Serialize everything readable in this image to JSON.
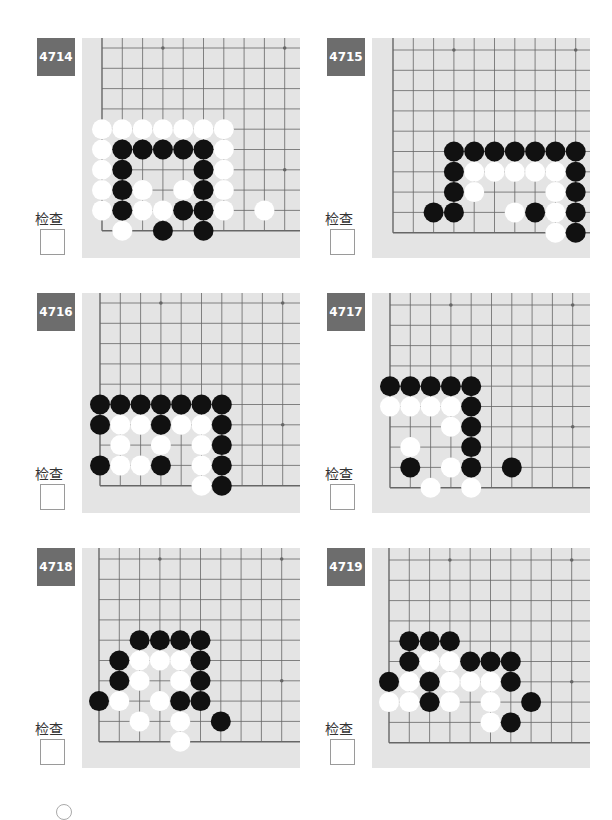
{
  "check_label": "检查",
  "colors": {
    "label_bg": "#6d6d6d",
    "board_bg": "#e4e4e4",
    "grid_line": "#666666",
    "black_stone": "#111111",
    "white_stone": "#ffffff"
  },
  "problems": [
    {
      "id": "4714",
      "pos": [
        30,
        30
      ],
      "grid_origin": [
        20,
        10
      ],
      "stones": {
        "white": [
          [
            0,
            4
          ],
          [
            1,
            4
          ],
          [
            2,
            4
          ],
          [
            3,
            4
          ],
          [
            4,
            4
          ],
          [
            5,
            4
          ],
          [
            6,
            4
          ],
          [
            0,
            5
          ],
          [
            6,
            5
          ],
          [
            0,
            6
          ],
          [
            6,
            6
          ],
          [
            0,
            7
          ],
          [
            2,
            7
          ],
          [
            4,
            7
          ],
          [
            6,
            7
          ],
          [
            0,
            8
          ],
          [
            2,
            8
          ],
          [
            3,
            8
          ],
          [
            6,
            8
          ],
          [
            8,
            8
          ],
          [
            1,
            9
          ]
        ],
        "black": [
          [
            1,
            5
          ],
          [
            2,
            5
          ],
          [
            3,
            5
          ],
          [
            4,
            5
          ],
          [
            5,
            5
          ],
          [
            1,
            6
          ],
          [
            5,
            6
          ],
          [
            1,
            7
          ],
          [
            5,
            7
          ],
          [
            1,
            8
          ],
          [
            4,
            8
          ],
          [
            5,
            8
          ],
          [
            3,
            9
          ],
          [
            5,
            9
          ]
        ]
      }
    },
    {
      "id": "4715",
      "pos": [
        320,
        30
      ],
      "grid_origin": [
        21,
        12
      ],
      "stones": {
        "white": [
          [
            4,
            6
          ],
          [
            5,
            6
          ],
          [
            6,
            6
          ],
          [
            7,
            6
          ],
          [
            8,
            6
          ],
          [
            4,
            7
          ],
          [
            8,
            7
          ],
          [
            6,
            8
          ],
          [
            8,
            8
          ],
          [
            8,
            9
          ]
        ],
        "black": [
          [
            3,
            5
          ],
          [
            4,
            5
          ],
          [
            5,
            5
          ],
          [
            6,
            5
          ],
          [
            7,
            5
          ],
          [
            8,
            5
          ],
          [
            9,
            5
          ],
          [
            3,
            6
          ],
          [
            9,
            6
          ],
          [
            3,
            7
          ],
          [
            9,
            7
          ],
          [
            2,
            8
          ],
          [
            3,
            8
          ],
          [
            7,
            8
          ],
          [
            9,
            8
          ],
          [
            9,
            9
          ]
        ]
      }
    },
    {
      "id": "4716",
      "pos": [
        30,
        285
      ],
      "grid_origin": [
        18,
        10
      ],
      "stones": {
        "white": [
          [
            1,
            6
          ],
          [
            2,
            6
          ],
          [
            4,
            6
          ],
          [
            5,
            6
          ],
          [
            1,
            7
          ],
          [
            3,
            7
          ],
          [
            5,
            7
          ],
          [
            1,
            8
          ],
          [
            2,
            8
          ],
          [
            5,
            8
          ],
          [
            5,
            9
          ]
        ],
        "black": [
          [
            0,
            5
          ],
          [
            1,
            5
          ],
          [
            2,
            5
          ],
          [
            3,
            5
          ],
          [
            4,
            5
          ],
          [
            5,
            5
          ],
          [
            6,
            5
          ],
          [
            0,
            6
          ],
          [
            3,
            6
          ],
          [
            6,
            6
          ],
          [
            6,
            7
          ],
          [
            0,
            8
          ],
          [
            3,
            8
          ],
          [
            6,
            8
          ],
          [
            6,
            9
          ]
        ]
      }
    },
    {
      "id": "4717",
      "pos": [
        320,
        285
      ],
      "grid_origin": [
        18,
        12
      ],
      "stones": {
        "white": [
          [
            0,
            5
          ],
          [
            1,
            5
          ],
          [
            2,
            5
          ],
          [
            3,
            5
          ],
          [
            3,
            6
          ],
          [
            1,
            7
          ],
          [
            3,
            8
          ],
          [
            2,
            9
          ],
          [
            4,
            9
          ]
        ],
        "black": [
          [
            0,
            4
          ],
          [
            1,
            4
          ],
          [
            2,
            4
          ],
          [
            3,
            4
          ],
          [
            4,
            4
          ],
          [
            4,
            5
          ],
          [
            4,
            6
          ],
          [
            4,
            7
          ],
          [
            1,
            8
          ],
          [
            4,
            8
          ],
          [
            6,
            8
          ]
        ]
      }
    },
    {
      "id": "4718",
      "pos": [
        30,
        540
      ],
      "grid_origin": [
        17,
        11
      ],
      "stones": {
        "white": [
          [
            2,
            5
          ],
          [
            3,
            5
          ],
          [
            4,
            5
          ],
          [
            2,
            6
          ],
          [
            4,
            6
          ],
          [
            1,
            7
          ],
          [
            3,
            7
          ],
          [
            2,
            8
          ],
          [
            4,
            8
          ],
          [
            4,
            9
          ]
        ],
        "black": [
          [
            2,
            4
          ],
          [
            3,
            4
          ],
          [
            4,
            4
          ],
          [
            5,
            4
          ],
          [
            1,
            5
          ],
          [
            5,
            5
          ],
          [
            1,
            6
          ],
          [
            5,
            6
          ],
          [
            0,
            7
          ],
          [
            4,
            7
          ],
          [
            5,
            7
          ],
          [
            6,
            8
          ]
        ]
      }
    },
    {
      "id": "4719",
      "pos": [
        320,
        540
      ],
      "grid_origin": [
        17,
        12
      ],
      "stones": {
        "white": [
          [
            2,
            5
          ],
          [
            3,
            5
          ],
          [
            1,
            6
          ],
          [
            3,
            6
          ],
          [
            4,
            6
          ],
          [
            5,
            6
          ],
          [
            0,
            7
          ],
          [
            1,
            7
          ],
          [
            3,
            7
          ],
          [
            5,
            7
          ],
          [
            5,
            8
          ]
        ],
        "black": [
          [
            1,
            4
          ],
          [
            2,
            4
          ],
          [
            3,
            4
          ],
          [
            1,
            5
          ],
          [
            4,
            5
          ],
          [
            5,
            5
          ],
          [
            6,
            5
          ],
          [
            0,
            6
          ],
          [
            2,
            6
          ],
          [
            6,
            6
          ],
          [
            2,
            7
          ],
          [
            7,
            7
          ],
          [
            6,
            8
          ]
        ]
      }
    }
  ]
}
